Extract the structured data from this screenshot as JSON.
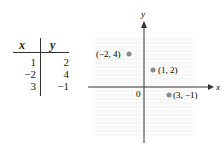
{
  "table": {
    "headers": [
      "x",
      "y"
    ],
    "rows": [
      [
        "1",
        "2"
      ],
      [
        "−2",
        "4"
      ],
      [
        "3",
        "−1"
      ]
    ]
  },
  "graph": {
    "x_axis_label": "x",
    "y_axis_label": "y",
    "origin_label": "0",
    "points": [
      {
        "x": -2,
        "y": 4,
        "label": "(−2, 4)"
      },
      {
        "x": 1,
        "y": 2,
        "label": "(1, 2)"
      },
      {
        "x": 3,
        "y": -1,
        "label": "(3, −1)"
      }
    ],
    "point_color": "#8a8a8a",
    "grid_color": "#d8d8d8"
  }
}
